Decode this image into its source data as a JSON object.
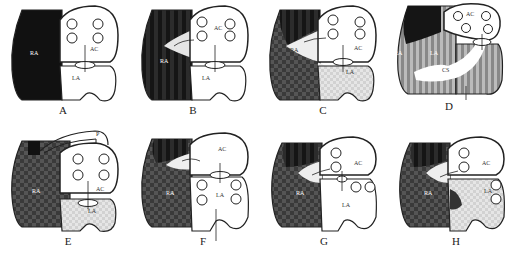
{
  "figure": {
    "panels": [
      {
        "id": "A",
        "caption": "A",
        "labels": {
          "ra": "RA",
          "ac": "AC",
          "la": "LA"
        }
      },
      {
        "id": "B",
        "caption": "B",
        "labels": {
          "ra": "RA",
          "ac": "AC",
          "la": "LA"
        }
      },
      {
        "id": "C",
        "caption": "C",
        "labels": {
          "ra": "RA",
          "ac": "AC",
          "la": "LA"
        }
      },
      {
        "id": "D",
        "caption": "D",
        "labels": {
          "ra": "RA",
          "ac": "AC",
          "la": "LA",
          "cs": "CS"
        }
      },
      {
        "id": "E",
        "caption": "E",
        "labels": {
          "ra": "RA",
          "ac": "AC",
          "la": "LA",
          "p": "P"
        }
      },
      {
        "id": "F",
        "caption": "F",
        "labels": {
          "ra": "RA",
          "ac": "AC",
          "la": "LA"
        }
      },
      {
        "id": "G",
        "caption": "G",
        "labels": {
          "ra": "RA",
          "ac": "AC",
          "la": "LA"
        }
      },
      {
        "id": "H",
        "caption": "H",
        "labels": {
          "ra": "RA",
          "ac": "AC",
          "la": "LA"
        }
      }
    ]
  },
  "colors": {
    "dark": "#1a1a1a",
    "mid": "#555555",
    "light": "#d8d8d8",
    "line": "#222222"
  }
}
